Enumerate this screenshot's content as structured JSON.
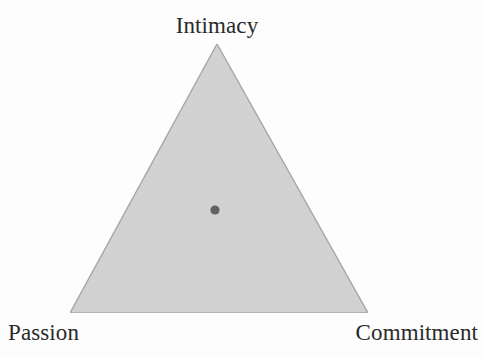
{
  "figure": {
    "kind": "triangle-diagram",
    "background_color": "#fdfdfd",
    "labels": {
      "apex": "Intimacy",
      "bottom_left": "Passion",
      "bottom_right": "Commitment"
    }
  },
  "chart_data": {
    "type": "scatter",
    "title": "",
    "subtitle": "",
    "xlabel": "",
    "ylabel": "",
    "plot_shape": "ternary-triangle",
    "grid": false,
    "legend": null,
    "axes": [
      {
        "name": "Intimacy",
        "vertex": "top",
        "position": [
          217,
          44
        ]
      },
      {
        "name": "Passion",
        "vertex": "bottom-left",
        "position": [
          70,
          313
        ]
      },
      {
        "name": "Commitment",
        "vertex": "bottom-right",
        "position": [
          368,
          313
        ]
      }
    ],
    "triangle": {
      "points": "217,44 70,313 368,313",
      "fill_color": "#d4d4d4",
      "stroke_color": "#a9a9a9",
      "stroke_width": 1.4
    },
    "points": [
      {
        "label": "",
        "x": 215,
        "y": 210,
        "radius": 4.6,
        "color": "#636363",
        "intimacy": 0.38,
        "passion": 0.31,
        "commitment": 0.31
      }
    ],
    "xlim": [
      0,
      484
    ],
    "ylim": [
      0,
      357
    ]
  },
  "colors": {
    "triangle_fill": "#d4d4d4",
    "triangle_stroke": "#a9a9a9",
    "point": "#636363",
    "text": "#2a2a2a",
    "background": "#fdfdfd"
  }
}
